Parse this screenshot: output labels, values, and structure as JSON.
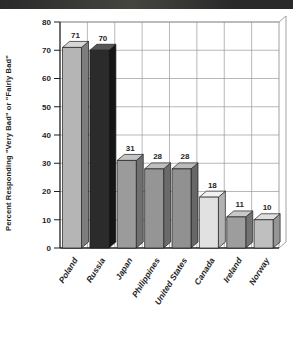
{
  "banner": {
    "label": "",
    "color": "#29292a",
    "highlight": "#45453f"
  },
  "chart_data": {
    "type": "bar",
    "variant": "3d-column",
    "title": "",
    "xlabel": "",
    "ylabel": "Percent Responding \"Very Bad\" or \"Fairly Bad\"",
    "ylim": [
      0,
      80
    ],
    "yticks": [
      0,
      10,
      20,
      30,
      40,
      50,
      60,
      70,
      80
    ],
    "grid": true,
    "legend": false,
    "categories": [
      "Poland",
      "Russia",
      "Japan",
      "Philippines",
      "United States",
      "Canada",
      "Ireland",
      "Norway"
    ],
    "values": [
      71,
      70,
      31,
      28,
      28,
      18,
      11,
      10
    ],
    "value_labels": [
      "71",
      "70",
      "31",
      "28",
      "28",
      "18",
      "11",
      "10"
    ],
    "bar_colors": [
      {
        "front": "#b5b5b5",
        "top": "#d6d6d6",
        "side": "#7d7d7d"
      },
      {
        "front": "#2b2b2b",
        "top": "#575757",
        "side": "#151515"
      },
      {
        "front": "#9b9b9b",
        "top": "#c4c4c4",
        "side": "#6f6f6f"
      },
      {
        "front": "#959595",
        "top": "#bfbfbf",
        "side": "#6a6a6a"
      },
      {
        "front": "#919191",
        "top": "#bbbbbb",
        "side": "#676767"
      },
      {
        "front": "#e1e1e1",
        "top": "#f1f1f1",
        "side": "#b2b2b2"
      },
      {
        "front": "#9d9d9d",
        "top": "#c8c8c8",
        "side": "#727272"
      },
      {
        "front": "#bfbfbf",
        "top": "#dfdfdf",
        "side": "#959595"
      }
    ],
    "colors": {
      "axis": "#1f1f1f",
      "grid": "#9a9a9a",
      "frame": "#8c8c8c",
      "bar_outline": "#1c1c1c",
      "text": "#1f1f1f",
      "background": "#ffffff"
    }
  }
}
